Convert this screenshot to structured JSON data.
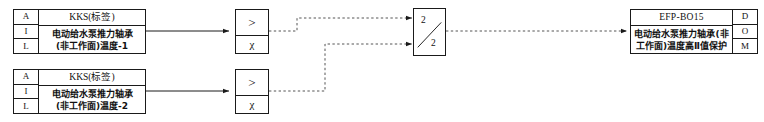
{
  "diagram": {
    "type": "control-logic-diagram",
    "line_color": "#1a1a1a",
    "background": "#ffffff"
  },
  "inputs": [
    {
      "rows": [
        "A",
        "I",
        "L"
      ],
      "header": "KKS(标签)",
      "text_line1": "电动给水泵推力轴承",
      "text_line2": "(非工作面)温度-1"
    },
    {
      "rows": [
        "A",
        "I",
        "L"
      ],
      "header": "KKS(标签)",
      "text_line1": "电动给水泵推力轴承",
      "text_line2": "(非工作面)温度-2"
    }
  ],
  "comparators": [
    {
      "operator": ">",
      "variable": "χ"
    },
    {
      "operator": ">",
      "variable": "χ"
    }
  ],
  "voter": {
    "top_label": "2",
    "bottom_label": "2"
  },
  "output": {
    "header": "EFP-BO15",
    "text_line1": "电动给水泵推力轴承(非",
    "text_line2": "工作面)温度高Ⅱ值保护",
    "rows": [
      "D",
      "O",
      "M"
    ]
  }
}
